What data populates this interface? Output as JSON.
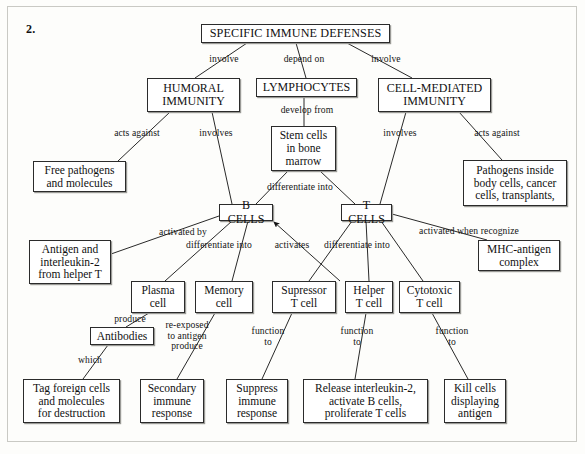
{
  "figure": {
    "number_label": "2.",
    "title": "SPECIFIC IMMUNE DEFENSES",
    "type": "concept-map",
    "ink_color": "#111111",
    "box_border_color": "#2b2b2b",
    "background_color": "#fdfdfb"
  },
  "nodes": [
    {
      "id": "specific-immune-defenses",
      "text": "SPECIFIC IMMUNE DEFENSES",
      "x": 201,
      "y": 24,
      "w": 189,
      "h": 19,
      "style": "title"
    },
    {
      "id": "humoral-immunity",
      "text": "HUMORAL\nIMMUNITY",
      "x": 147,
      "y": 78,
      "w": 93,
      "h": 34,
      "style": "caps"
    },
    {
      "id": "lymphocytes",
      "text": "LYMPHOCYTES",
      "x": 256,
      "y": 78,
      "w": 101,
      "h": 19,
      "style": "caps"
    },
    {
      "id": "cell-mediated-immunity",
      "text": "CELL-MEDIATED\nIMMUNITY",
      "x": 378,
      "y": 78,
      "w": 113,
      "h": 34,
      "style": "caps"
    },
    {
      "id": "stem-cells",
      "text": "Stem cells\nin bone\nmarrow",
      "x": 271,
      "y": 126,
      "w": 65,
      "h": 45,
      "style": ""
    },
    {
      "id": "free-pathogens",
      "text": "Free pathogens\nand molecules",
      "x": 33,
      "y": 161,
      "w": 93,
      "h": 31,
      "style": ""
    },
    {
      "id": "pathogens-inside",
      "text": "Pathogens inside\nbody cells, cancer\ncells, transplants,",
      "x": 463,
      "y": 160,
      "w": 104,
      "h": 46,
      "style": ""
    },
    {
      "id": "b-cells",
      "text": "B CELLS",
      "x": 219,
      "y": 204,
      "w": 54,
      "h": 17,
      "style": "caps"
    },
    {
      "id": "t-cells",
      "text": "T CELLS",
      "x": 341,
      "y": 204,
      "w": 51,
      "h": 17,
      "style": "caps"
    },
    {
      "id": "antigen-interleukin",
      "text": "Antigen and\ninterleukin-2\nfrom helper T",
      "x": 29,
      "y": 240,
      "w": 82,
      "h": 44,
      "style": ""
    },
    {
      "id": "mhc-antigen-complex",
      "text": "MHC-antigen\ncomplex",
      "x": 478,
      "y": 240,
      "w": 82,
      "h": 31,
      "style": ""
    },
    {
      "id": "plasma-cell",
      "text": "Plasma\ncell",
      "x": 131,
      "y": 281,
      "w": 54,
      "h": 32,
      "style": ""
    },
    {
      "id": "memory-cell",
      "text": "Memory\ncell",
      "x": 195,
      "y": 281,
      "w": 58,
      "h": 32,
      "style": ""
    },
    {
      "id": "supressor-t-cell",
      "text": "Supressor\nT cell",
      "x": 272,
      "y": 281,
      "w": 64,
      "h": 32,
      "style": ""
    },
    {
      "id": "helper-t-cell",
      "text": "Helper\nT cell",
      "x": 345,
      "y": 281,
      "w": 48,
      "h": 32,
      "style": ""
    },
    {
      "id": "cytotoxic-t-cell",
      "text": "Cytotoxic\nT cell",
      "x": 399,
      "y": 281,
      "w": 61,
      "h": 32,
      "style": ""
    },
    {
      "id": "antibodies",
      "text": "Antibodies",
      "x": 90,
      "y": 327,
      "w": 64,
      "h": 18,
      "style": ""
    },
    {
      "id": "tag-foreign-cells",
      "text": "Tag foreign cells\nand molecules\nfor destruction",
      "x": 23,
      "y": 379,
      "w": 97,
      "h": 44,
      "style": ""
    },
    {
      "id": "secondary-immune-response",
      "text": "Secondary\nimmune\nresponse",
      "x": 140,
      "y": 379,
      "w": 64,
      "h": 44,
      "style": ""
    },
    {
      "id": "suppress-immune-response",
      "text": "Suppress\nimmune\nresponse",
      "x": 226,
      "y": 379,
      "w": 62,
      "h": 44,
      "style": ""
    },
    {
      "id": "release-interleukin",
      "text": "Release interleukin-2,\nactivate B cells,\nproliferate T cells",
      "x": 303,
      "y": 379,
      "w": 125,
      "h": 44,
      "style": ""
    },
    {
      "id": "kill-cells",
      "text": "Kill cells\ndisplaying\nantigen",
      "x": 444,
      "y": 379,
      "w": 62,
      "h": 44,
      "style": ""
    }
  ],
  "edges": [
    {
      "id": "sid-to-humoral",
      "label": "involve",
      "from": "specific-immune-defenses",
      "to": "humoral-immunity",
      "line": [
        [
          247,
          43
        ],
        [
          195,
          78
        ]
      ],
      "label_x": 200,
      "label_y": 54,
      "label_w": 48
    },
    {
      "id": "sid-to-lymphocytes",
      "label": "depend on",
      "from": "specific-immune-defenses",
      "to": "lymphocytes",
      "line": [
        [
          296,
          43
        ],
        [
          306,
          78
        ]
      ],
      "label_x": 274,
      "label_y": 54,
      "label_w": 60
    },
    {
      "id": "sid-to-cellmediated",
      "label": "involve",
      "from": "specific-immune-defenses",
      "to": "cell-mediated-immunity",
      "line": [
        [
          347,
          43
        ],
        [
          412,
          78
        ]
      ],
      "label_x": 362,
      "label_y": 54,
      "label_w": 48
    },
    {
      "id": "humoral-to-freepathogens",
      "label": "acts against",
      "from": "humoral-immunity",
      "to": "free-pathogens",
      "line": [
        [
          170,
          112
        ],
        [
          118,
          161
        ]
      ],
      "label_x": 102,
      "label_y": 128,
      "label_w": 70
    },
    {
      "id": "humoral-to-bcells",
      "label": "involves",
      "from": "humoral-immunity",
      "to": "b-cells",
      "line": [
        [
          212,
          112
        ],
        [
          232,
          204
        ]
      ],
      "label_x": 190,
      "label_y": 128,
      "label_w": 52
    },
    {
      "id": "lymphocytes-to-stemcells",
      "label": "develop from",
      "from": "lymphocytes",
      "to": "stem-cells",
      "line": [
        [
          304,
          97
        ],
        [
          304,
          126
        ]
      ],
      "label_x": 272,
      "label_y": 105,
      "label_w": 70
    },
    {
      "id": "stemcells-to-bcells",
      "label": "differentiate into",
      "from": "stem-cells",
      "to": "b-cells",
      "line": [
        [
          288,
          171
        ],
        [
          256,
          204
        ]
      ],
      "label_x": 254,
      "label_y": 182,
      "label_w": 92
    },
    {
      "id": "stemcells-to-tcells",
      "label": "",
      "from": "stem-cells",
      "to": "t-cells",
      "line": [
        [
          320,
          171
        ],
        [
          355,
          204
        ]
      ],
      "label_x": 0,
      "label_y": 0,
      "label_w": 0
    },
    {
      "id": "cellmediated-to-tcells",
      "label": "involves",
      "from": "cell-mediated-immunity",
      "to": "t-cells",
      "line": [
        [
          406,
          112
        ],
        [
          380,
          204
        ]
      ],
      "label_x": 374,
      "label_y": 128,
      "label_w": 52
    },
    {
      "id": "cellmediated-to-pathogensinside",
      "label": "acts against",
      "from": "cell-mediated-immunity",
      "to": "pathogens-inside",
      "line": [
        [
          459,
          112
        ],
        [
          502,
          160
        ]
      ],
      "label_x": 462,
      "label_y": 128,
      "label_w": 70
    },
    {
      "id": "bcells-to-antigen",
      "label": "activated by",
      "from": "antigen-interleukin",
      "to": "b-cells",
      "line": [
        [
          219,
          216
        ],
        [
          111,
          254
        ]
      ],
      "label_x": 147,
      "label_y": 227,
      "label_w": 72
    },
    {
      "id": "bcells-to-plasma",
      "label": "differentiate into",
      "from": "b-cells",
      "to": "plasma-cell",
      "line": [
        [
          232,
          221
        ],
        [
          165,
          281
        ]
      ],
      "label_x": 173,
      "label_y": 240,
      "label_w": 92
    },
    {
      "id": "bcells-to-memory",
      "label": "",
      "from": "b-cells",
      "to": "memory-cell",
      "line": [
        [
          248,
          221
        ],
        [
          232,
          281
        ]
      ],
      "label_x": 0,
      "label_y": 0,
      "label_w": 0
    },
    {
      "id": "helper-activates-bcells",
      "label": "activates",
      "from": "helper-t-cell",
      "to": "b-cells",
      "line": [
        [
          340,
          281
        ],
        [
          274,
          222
        ]
      ],
      "label_x": 264,
      "label_y": 240,
      "label_w": 56,
      "arrow": true
    },
    {
      "id": "tcells-to-supressor",
      "label": "differentiate into",
      "from": "t-cells",
      "to": "supressor-t-cell",
      "line": [
        [
          352,
          221
        ],
        [
          309,
          281
        ]
      ],
      "label_x": 311,
      "label_y": 240,
      "label_w": 92
    },
    {
      "id": "tcells-to-helper",
      "label": "",
      "from": "t-cells",
      "to": "helper-t-cell",
      "line": [
        [
          366,
          221
        ],
        [
          369,
          281
        ]
      ],
      "label_x": 0,
      "label_y": 0,
      "label_w": 0
    },
    {
      "id": "tcells-to-cytotoxic",
      "label": "",
      "from": "t-cells",
      "to": "cytotoxic-t-cell",
      "line": [
        [
          381,
          221
        ],
        [
          423,
          281
        ]
      ],
      "label_x": 0,
      "label_y": 0,
      "label_w": 0
    },
    {
      "id": "tcells-to-mhc",
      "label": "activated when recognize",
      "from": "t-cells",
      "to": "mhc-antigen-complex",
      "line": [
        [
          392,
          214
        ],
        [
          487,
          240
        ]
      ],
      "label_x": 404,
      "label_y": 226,
      "label_w": 130
    },
    {
      "id": "plasma-to-antibodies",
      "label": "produce",
      "from": "plasma-cell",
      "to": "antibodies",
      "line": [
        [
          149,
          313
        ],
        [
          126,
          327
        ]
      ],
      "label_x": 104,
      "label_y": 314,
      "label_w": 52
    },
    {
      "id": "antibodies-to-tag",
      "label": "which",
      "from": "antibodies",
      "to": "tag-foreign-cells",
      "line": [
        [
          108,
          345
        ],
        [
          83,
          379
        ]
      ],
      "label_x": 68,
      "label_y": 355,
      "label_w": 44
    },
    {
      "id": "memory-to-secondary",
      "label": "re-exposed\nto antigen\nproduce",
      "from": "memory-cell",
      "to": "secondary-immune-response",
      "line": [
        [
          215,
          313
        ],
        [
          177,
          379
        ]
      ],
      "label_x": 155,
      "label_y": 320,
      "label_w": 64
    },
    {
      "id": "supressor-to-suppress",
      "label": "function\nto",
      "from": "supressor-t-cell",
      "to": "suppress-immune-response",
      "line": [
        [
          292,
          313
        ],
        [
          262,
          379
        ]
      ],
      "label_x": 240,
      "label_y": 326,
      "label_w": 56
    },
    {
      "id": "helper-to-release",
      "label": "function\nto",
      "from": "helper-t-cell",
      "to": "release-interleukin",
      "line": [
        [
          366,
          313
        ],
        [
          355,
          379
        ]
      ],
      "label_x": 329,
      "label_y": 326,
      "label_w": 56
    },
    {
      "id": "cytotoxic-to-kill",
      "label": "function\nto",
      "from": "cytotoxic-t-cell",
      "to": "kill-cells",
      "line": [
        [
          432,
          313
        ],
        [
          468,
          379
        ]
      ],
      "label_x": 424,
      "label_y": 326,
      "label_w": 56
    }
  ]
}
